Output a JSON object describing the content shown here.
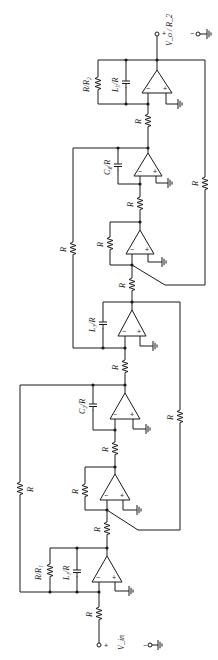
{
  "diagram": {
    "type": "circuit-schematic",
    "input": {
      "label": "V_in",
      "plus": "+",
      "minus": "−"
    },
    "output": {
      "label": "V_o / R_2",
      "plus": "+",
      "minus": "−"
    },
    "labels": {
      "r": "R",
      "rr1": "R/R₁",
      "rr2": "R/R₂",
      "l1": "L₁/R",
      "c2": "C₂/R",
      "l3": "L₃/R",
      "c4": "C₄/R",
      "l5": "L₅/R",
      "opamp_minus": "−",
      "opamp_plus": "+"
    },
    "stages": [
      {
        "id": "integrator-1",
        "feedback": [
          "R/R₁",
          "L₁/R"
        ]
      },
      {
        "id": "inverter-1",
        "feedback": [
          "R"
        ]
      },
      {
        "id": "integrator-2",
        "feedback": [
          "C₂/R"
        ]
      },
      {
        "id": "integrator-3",
        "feedback": [
          "L₃/R"
        ]
      },
      {
        "id": "inverter-2",
        "feedback": [
          "R"
        ]
      },
      {
        "id": "integrator-4",
        "feedback": [
          "C₄/R"
        ]
      },
      {
        "id": "integrator-5",
        "feedback": [
          "R/R₂",
          "L₅/R"
        ]
      }
    ],
    "colors": {
      "ink": "#1a1a1a",
      "background": "#ffffff"
    }
  }
}
